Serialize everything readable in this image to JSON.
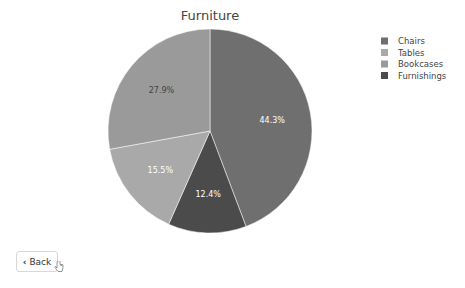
{
  "chart_data": {
    "type": "pie",
    "title": "Furniture",
    "categories": [
      "Chairs",
      "Tables",
      "Bookcases",
      "Furnishings"
    ],
    "values": [
      44.3,
      15.5,
      27.9,
      12.4
    ],
    "labels": [
      "44.3%",
      "15.5%",
      "27.9%",
      "12.4%"
    ],
    "colors": [
      "#6f6f6f",
      "#a9a9a9",
      "#9a9a9a",
      "#4b4b4b"
    ],
    "label_colors": [
      "#ffffff",
      "#ffffff",
      "#444444",
      "#ffffff"
    ],
    "draw_order": [
      "Chairs",
      "Furnishings",
      "Tables",
      "Bookcases"
    ],
    "direction": "clockwise",
    "start": "top",
    "legend_position": "top-right"
  },
  "back_button": {
    "label": "Back"
  }
}
